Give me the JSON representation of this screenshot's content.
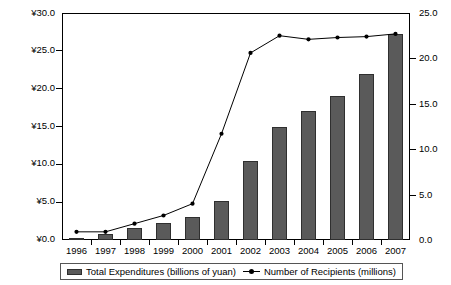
{
  "chart_data": {
    "type": "bar",
    "title": "",
    "subtitle": "",
    "xlabel": "",
    "ylabel": "",
    "grid": false,
    "legend_position": "bottom",
    "categories": [
      "1996",
      "1997",
      "1998",
      "1999",
      "2000",
      "2001",
      "2002",
      "2003",
      "2004",
      "2005",
      "2006",
      "2007"
    ],
    "axes": {
      "left": {
        "label": "",
        "prefix": "¥",
        "min": 0.0,
        "max": 30.0,
        "step": 5.0,
        "ticks": [
          "¥0.0",
          "¥5.0",
          "¥10.0",
          "¥15.0",
          "¥20.0",
          "¥25.0",
          "¥30.0"
        ]
      },
      "right": {
        "label": "",
        "min": 0.0,
        "max": 25.0,
        "step": 5.0,
        "ticks": [
          "0.0",
          "5.0",
          "10.0",
          "15.0",
          "20.0",
          "25.0"
        ]
      }
    },
    "series": [
      {
        "name": "Total Expenditures (billions of yuan)",
        "type": "bar",
        "axis": "left",
        "color": "#5a5a5a",
        "values": [
          0.2,
          0.8,
          1.6,
          2.2,
          3.0,
          5.2,
          10.5,
          14.9,
          17.0,
          19.0,
          22.0,
          27.2
        ]
      },
      {
        "name": "Number of Recipients (millions)",
        "type": "line",
        "axis": "right",
        "color": "#000000",
        "values": [
          0.9,
          0.9,
          1.8,
          2.7,
          4.0,
          11.7,
          20.6,
          22.5,
          22.1,
          22.3,
          22.4,
          22.7
        ]
      }
    ]
  },
  "legend": {
    "entries": [
      {
        "label": "Total Expenditures (billions of yuan)",
        "marker": "bar-swatch-icon"
      },
      {
        "label": "Number of Recipients (millions)",
        "marker": "line-marker-icon"
      }
    ]
  }
}
